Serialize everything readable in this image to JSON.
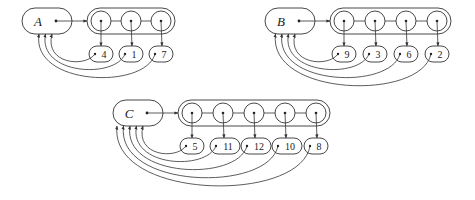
{
  "diagram": {
    "colors": {
      "stroke": "#333333",
      "background": "#ffffff"
    },
    "sets": [
      {
        "name": "A",
        "members": [
          "4",
          "1",
          "7"
        ]
      },
      {
        "name": "B",
        "members": [
          "9",
          "3",
          "6",
          "2"
        ]
      },
      {
        "name": "C",
        "members": [
          "5",
          "11",
          "12",
          "10",
          "8"
        ]
      }
    ]
  }
}
